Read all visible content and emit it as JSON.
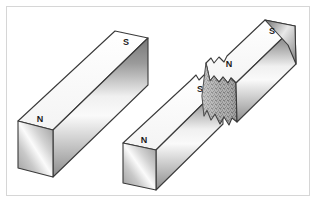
{
  "figure": {
    "background_color": "#ffffff",
    "frame_border_color": "#d6d6d6"
  },
  "palette": {
    "outline": "#3a3a3a",
    "top_face_light": "#ffffff",
    "top_face_shade": "#f2f2f2",
    "front_face_dark": "#6f6f6f",
    "front_face_light": "#f4f4f4",
    "end_face_dark": "#8f8f8f",
    "end_face_light": "#fbfbfb",
    "fracture_base": "#b9b9b9",
    "fracture_speckle": "#5d5d5d",
    "label_color": "#1a1a1a"
  },
  "magnets": [
    {
      "name": "intact-magnet",
      "labels": [
        {
          "pole": "N",
          "position": "near-end-top-face"
        },
        {
          "pole": "S",
          "position": "far-end-top-face"
        }
      ]
    },
    {
      "name": "broken-magnet",
      "pieces": [
        {
          "name": "lower-left-piece",
          "labels": [
            {
              "pole": "N",
              "position": "free-end-top-face"
            },
            {
              "pole": "S",
              "position": "fracture-end-top-face"
            }
          ]
        },
        {
          "name": "upper-right-piece",
          "labels": [
            {
              "pole": "N",
              "position": "fracture-end-top-face"
            },
            {
              "pole": "S",
              "position": "free-end-top-face"
            }
          ]
        }
      ]
    }
  ],
  "labels": {
    "intact_n": "N",
    "intact_s": "S",
    "lower_piece_n": "N",
    "lower_piece_s": "S",
    "upper_piece_n": "N",
    "upper_piece_s": "S"
  }
}
